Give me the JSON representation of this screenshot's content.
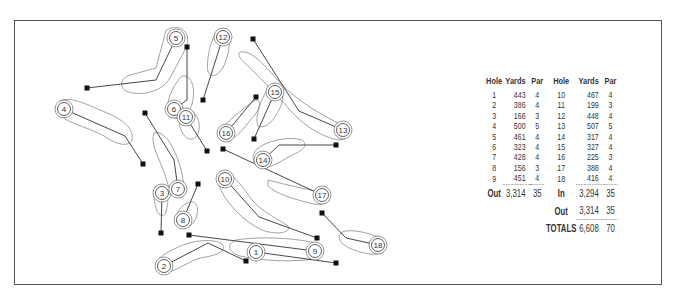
{
  "scorecard": {
    "headers": [
      "Hole",
      "Yards",
      "Par",
      "Hole",
      "Yards",
      "Par"
    ],
    "front": [
      {
        "hole": "1",
        "yards": "443",
        "par": "4"
      },
      {
        "hole": "2",
        "yards": "386",
        "par": "4"
      },
      {
        "hole": "3",
        "yards": "166",
        "par": "3"
      },
      {
        "hole": "4",
        "yards": "500",
        "par": "5"
      },
      {
        "hole": "5",
        "yards": "461",
        "par": "4"
      },
      {
        "hole": "6",
        "yards": "323",
        "par": "4"
      },
      {
        "hole": "7",
        "yards": "428",
        "par": "4"
      },
      {
        "hole": "8",
        "yards": "156",
        "par": "3"
      },
      {
        "hole": "9",
        "yards": "451",
        "par": "4"
      }
    ],
    "back": [
      {
        "hole": "10",
        "yards": "467",
        "par": "4"
      },
      {
        "hole": "11",
        "yards": "199",
        "par": "3"
      },
      {
        "hole": "12",
        "yards": "448",
        "par": "4"
      },
      {
        "hole": "13",
        "yards": "507",
        "par": "5"
      },
      {
        "hole": "14",
        "yards": "317",
        "par": "4"
      },
      {
        "hole": "15",
        "yards": "327",
        "par": "4"
      },
      {
        "hole": "16",
        "yards": "225",
        "par": "3"
      },
      {
        "hole": "17",
        "yards": "388",
        "par": "4"
      },
      {
        "hole": "18",
        "yards": "416",
        "par": "4"
      }
    ],
    "out": {
      "label": "Out",
      "yards": "3,314",
      "par": "35"
    },
    "in": {
      "label": "In",
      "yards": "3,294",
      "par": "35"
    },
    "out_repeat": {
      "label": "Out",
      "yards": "3,314",
      "par": "35"
    },
    "totals": {
      "label": "TOTALS",
      "yards": "6,608",
      "par": "70"
    }
  },
  "map": {
    "holes": [
      {
        "number": "1",
        "tee": [
          336,
          263
        ],
        "bend": null,
        "green": [
          256,
          252
        ]
      },
      {
        "number": "2",
        "tee": [
          246,
          261
        ],
        "bend": [
          208,
          243
        ],
        "green": [
          164,
          266
        ]
      },
      {
        "number": "3",
        "tee": [
          161,
          233
        ],
        "bend": null,
        "green": [
          162,
          193
        ]
      },
      {
        "number": "4",
        "tee": [
          143,
          164
        ],
        "bend": [
          125,
          136
        ],
        "green": [
          64,
          109
        ]
      },
      {
        "number": "5",
        "tee": [
          87,
          88
        ],
        "bend": [
          156,
          80
        ],
        "green": [
          176,
          38
        ]
      },
      {
        "number": "6",
        "tee": [
          187,
          47
        ],
        "bend": [
          187,
          100
        ],
        "green": [
          174,
          109
        ]
      },
      {
        "number": "7",
        "tee": [
          145,
          113
        ],
        "bend": [
          174,
          160
        ],
        "green": [
          178,
          189
        ]
      },
      {
        "number": "8",
        "tee": [
          198,
          184
        ],
        "bend": null,
        "green": [
          183,
          220
        ]
      },
      {
        "number": "9",
        "tee": [
          189,
          235
        ],
        "bend": null,
        "green": [
          315,
          251
        ]
      },
      {
        "number": "10",
        "tee": [
          317,
          238
        ],
        "bend": [
          259,
          217
        ],
        "green": [
          225,
          179
        ]
      },
      {
        "number": "11",
        "tee": [
          207,
          151
        ],
        "bend": null,
        "green": [
          186,
          117
        ]
      },
      {
        "number": "12",
        "tee": [
          203,
          100
        ],
        "bend": null,
        "green": [
          223,
          37
        ]
      },
      {
        "number": "13",
        "tee": [
          253,
          39
        ],
        "bend": [
          299,
          111
        ],
        "green": [
          343,
          130
        ]
      },
      {
        "number": "14",
        "tee": [
          336,
          145
        ],
        "bend": [
          279,
          145
        ],
        "green": [
          263,
          160
        ]
      },
      {
        "number": "15",
        "tee": [
          254,
          139
        ],
        "bend": null,
        "green": [
          275,
          92
        ]
      },
      {
        "number": "16",
        "tee": [
          256,
          97
        ],
        "bend": null,
        "green": [
          226,
          133
        ]
      },
      {
        "number": "17",
        "tee": [
          223,
          149
        ],
        "bend": null,
        "green": [
          322,
          195
        ]
      },
      {
        "number": "18",
        "tee": [
          322,
          213
        ],
        "bend": [
          346,
          238
        ],
        "green": [
          378,
          245
        ]
      }
    ]
  }
}
